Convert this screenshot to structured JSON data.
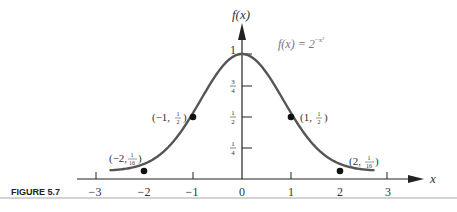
{
  "figure": {
    "caption": "FIGURE 5.7",
    "y_axis_label": "f(x)",
    "x_axis_label": "x",
    "function_label": "f(x) = 2",
    "function_exponent": "−x²",
    "x_ticks": [
      "−3",
      "−2",
      "−1",
      "0",
      "1",
      "2",
      "3"
    ],
    "y_ticks": [
      "1",
      "3/4",
      "1/2",
      "1/4"
    ],
    "points": [
      {
        "label_main": "(−2, ",
        "num": "1",
        "den": "16",
        "x": -2,
        "y": 0.0625
      },
      {
        "label_main": "(−1, ",
        "num": "1",
        "den": "2",
        "x": -1,
        "y": 0.5
      },
      {
        "label_main": "(1, ",
        "num": "1",
        "den": "2",
        "x": 1,
        "y": 0.5
      },
      {
        "label_main": "(2, ",
        "num": "1",
        "den": "16",
        "x": 2,
        "y": 0.0625
      }
    ],
    "colors": {
      "curve": "#555555",
      "axis": "#222222",
      "text": "#333333",
      "rule": "#bbbbbb"
    }
  },
  "chart_data": {
    "type": "line",
    "title": "",
    "caption": "FIGURE 5.7",
    "xlabel": "x",
    "ylabel": "f(x)",
    "function": "f(x) = 2^(-x^2)",
    "xlim": [
      -3,
      3
    ],
    "ylim": [
      0,
      1
    ],
    "x_tick_labels": [
      "-3",
      "-2",
      "-1",
      "0",
      "1",
      "2",
      "3"
    ],
    "y_tick_labels": [
      "1/4",
      "1/2",
      "3/4",
      "1"
    ],
    "grid": false,
    "legend": null,
    "series": [
      {
        "name": "f(x) = 2^(-x^2)",
        "x": [
          -2.7,
          -2.5,
          -2,
          -1.5,
          -1,
          -0.5,
          0,
          0.5,
          1,
          1.5,
          2,
          2.5,
          2.7
        ],
        "values": [
          0.0064,
          0.0131,
          0.0625,
          0.2102,
          0.5,
          0.8409,
          1,
          0.8409,
          0.5,
          0.2102,
          0.0625,
          0.0131,
          0.0064
        ]
      }
    ],
    "annotations": [
      {
        "text": "(-2, 1/16)",
        "x": -2,
        "y": 0.0625
      },
      {
        "text": "(-1, 1/2)",
        "x": -1,
        "y": 0.5
      },
      {
        "text": "(1, 1/2)",
        "x": 1,
        "y": 0.5
      },
      {
        "text": "(2, 1/16)",
        "x": 2,
        "y": 0.0625
      },
      {
        "text": "f(x) = 2^(-x^2)",
        "x": 0.7,
        "y": 0.8
      }
    ]
  }
}
